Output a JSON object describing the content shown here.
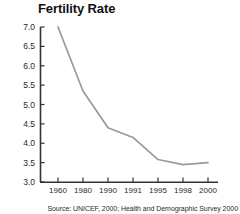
{
  "chart_data": {
    "type": "line",
    "title": "Fertility Rate",
    "xlabel": "",
    "ylabel": "",
    "categories": [
      "1960",
      "1980",
      "1990",
      "1991",
      "1995",
      "1998",
      "2000"
    ],
    "values": [
      7.0,
      5.35,
      4.4,
      4.15,
      3.58,
      3.45,
      3.5
    ],
    "series": [
      {
        "name": "Fertility Rate",
        "values": [
          7.0,
          5.35,
          4.4,
          4.15,
          3.58,
          3.45,
          3.5
        ]
      }
    ],
    "ylim": [
      3.0,
      7.0
    ],
    "ytick_labels": [
      "7.0",
      "6.5",
      "6.0",
      "5.5",
      "5.0",
      "4.5",
      "4.0",
      "3.5",
      "3.0"
    ],
    "ytick_values": [
      7.0,
      6.5,
      6.0,
      5.5,
      5.0,
      4.5,
      4.0,
      3.5,
      3.0
    ],
    "grid": false,
    "legend": "none",
    "line_color": "#999999",
    "axis_color": "#333333",
    "background_color": "#ffffff"
  },
  "source": {
    "note": "Source: UNICEF, 2000; Health and Demographic Survey 2000"
  }
}
